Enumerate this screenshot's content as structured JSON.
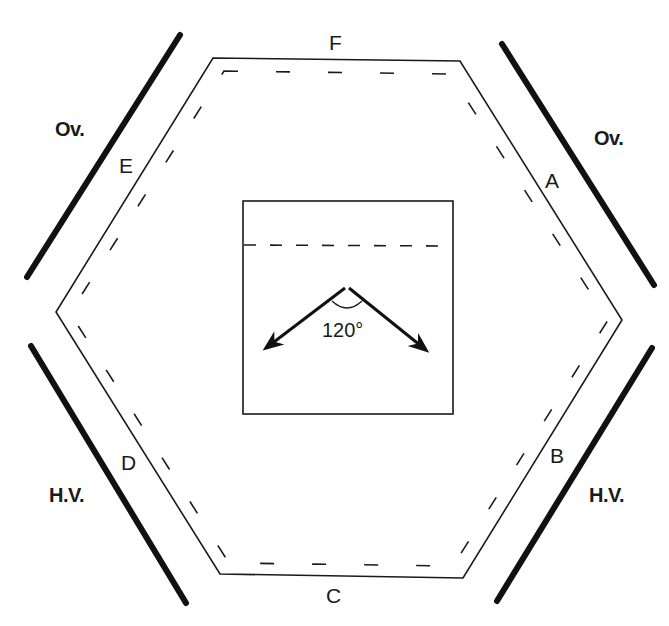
{
  "diagram": {
    "colors": {
      "line": "#1a1a1a",
      "background": "#ffffff"
    },
    "edge_labels": {
      "a": "A",
      "b": "B",
      "c": "C",
      "d": "D",
      "e": "E",
      "f": "F"
    },
    "bar_labels": {
      "top_left": "Ov.",
      "top_right": "Ov.",
      "bottom_left": "H.V.",
      "bottom_right": "H.V."
    },
    "inset": {
      "angle_label": "120°"
    }
  }
}
